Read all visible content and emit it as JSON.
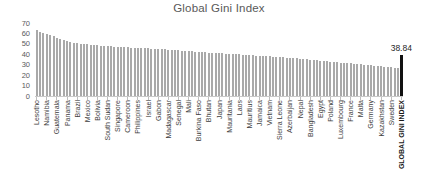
{
  "chart_data": {
    "type": "bar",
    "title": "Global Gini Index",
    "xlabel": "",
    "ylabel": "",
    "ylim": [
      0,
      70
    ],
    "yticks": [
      0,
      10,
      20,
      30,
      40,
      50,
      60,
      70
    ],
    "grid": false,
    "legend": false,
    "x_label_interval": 3,
    "bar_color": "#a9a9a9",
    "highlight_color": "#111111",
    "annotation": {
      "label": "38.84",
      "target": "GLOBAL GINI INDEX"
    },
    "bars": [
      {
        "label": "Lesotho",
        "value": 63.0
      },
      {
        "label": "",
        "value": 61.8
      },
      {
        "label": "",
        "value": 60.7
      },
      {
        "label": "Namibia",
        "value": 59.7
      },
      {
        "label": "",
        "value": 58.6
      },
      {
        "label": "",
        "value": 57.4
      },
      {
        "label": "Guatemala",
        "value": 56.0
      },
      {
        "label": "",
        "value": 54.8
      },
      {
        "label": "",
        "value": 53.6
      },
      {
        "label": "Panama",
        "value": 52.6
      },
      {
        "label": "",
        "value": 51.8
      },
      {
        "label": "",
        "value": 51.2
      },
      {
        "label": "Brazil",
        "value": 50.7
      },
      {
        "label": "",
        "value": 50.2
      },
      {
        "label": "",
        "value": 49.8
      },
      {
        "label": "Mexico",
        "value": 49.4
      },
      {
        "label": "",
        "value": 49.1
      },
      {
        "label": "",
        "value": 48.8
      },
      {
        "label": "Bolivia",
        "value": 48.5
      },
      {
        "label": "",
        "value": 48.2
      },
      {
        "label": "",
        "value": 48.0
      },
      {
        "label": "South Sudan",
        "value": 47.8
      },
      {
        "label": "",
        "value": 47.6
      },
      {
        "label": "",
        "value": 47.4
      },
      {
        "label": "Singapore",
        "value": 47.2
      },
      {
        "label": "",
        "value": 47.0
      },
      {
        "label": "",
        "value": 46.8
      },
      {
        "label": "Cameroon",
        "value": 46.6
      },
      {
        "label": "",
        "value": 46.5
      },
      {
        "label": "",
        "value": 46.3
      },
      {
        "label": "Philippines",
        "value": 46.1
      },
      {
        "label": "",
        "value": 45.9
      },
      {
        "label": "",
        "value": 45.8
      },
      {
        "label": "Israel",
        "value": 45.6
      },
      {
        "label": "",
        "value": 45.4
      },
      {
        "label": "",
        "value": 45.2
      },
      {
        "label": "Gabon",
        "value": 45.0
      },
      {
        "label": "",
        "value": 44.8
      },
      {
        "label": "",
        "value": 44.6
      },
      {
        "label": "Madagascar",
        "value": 44.4
      },
      {
        "label": "",
        "value": 44.1
      },
      {
        "label": "",
        "value": 43.9
      },
      {
        "label": "Senegal",
        "value": 43.7
      },
      {
        "label": "",
        "value": 43.4
      },
      {
        "label": "",
        "value": 43.2
      },
      {
        "label": "Mali",
        "value": 43.0
      },
      {
        "label": "",
        "value": 42.7
      },
      {
        "label": "",
        "value": 42.5
      },
      {
        "label": "Burkina Faso",
        "value": 42.3
      },
      {
        "label": "",
        "value": 42.0
      },
      {
        "label": "",
        "value": 41.8
      },
      {
        "label": "Bhutan",
        "value": 41.6
      },
      {
        "label": "",
        "value": 41.4
      },
      {
        "label": "",
        "value": 41.2
      },
      {
        "label": "Japan",
        "value": 41.0
      },
      {
        "label": "",
        "value": 40.8
      },
      {
        "label": "",
        "value": 40.6
      },
      {
        "label": "Mauritania",
        "value": 40.4
      },
      {
        "label": "",
        "value": 40.2
      },
      {
        "label": "",
        "value": 40.0
      },
      {
        "label": "Laos",
        "value": 39.8
      },
      {
        "label": "",
        "value": 39.6
      },
      {
        "label": "",
        "value": 39.4
      },
      {
        "label": "Mauritius",
        "value": 39.2
      },
      {
        "label": "",
        "value": 39.0
      },
      {
        "label": "",
        "value": 38.8
      },
      {
        "label": "Jamaica",
        "value": 38.6
      },
      {
        "label": "",
        "value": 38.4
      },
      {
        "label": "",
        "value": 38.2
      },
      {
        "label": "Vietnam",
        "value": 38.0
      },
      {
        "label": "",
        "value": 37.8
      },
      {
        "label": "",
        "value": 37.5
      },
      {
        "label": "Sierra Leone",
        "value": 37.3
      },
      {
        "label": "",
        "value": 37.0
      },
      {
        "label": "",
        "value": 36.8
      },
      {
        "label": "Azerbaijan",
        "value": 36.5
      },
      {
        "label": "",
        "value": 36.2
      },
      {
        "label": "",
        "value": 36.0
      },
      {
        "label": "Nepal",
        "value": 35.7
      },
      {
        "label": "",
        "value": 35.4
      },
      {
        "label": "",
        "value": 35.1
      },
      {
        "label": "Bangladesh",
        "value": 34.8
      },
      {
        "label": "",
        "value": 34.5
      },
      {
        "label": "",
        "value": 34.2
      },
      {
        "label": "Egypt",
        "value": 33.9
      },
      {
        "label": "",
        "value": 33.6
      },
      {
        "label": "",
        "value": 33.3
      },
      {
        "label": "Poland",
        "value": 33.0
      },
      {
        "label": "",
        "value": 32.7
      },
      {
        "label": "",
        "value": 32.4
      },
      {
        "label": "Luxembourg",
        "value": 32.1
      },
      {
        "label": "",
        "value": 31.8
      },
      {
        "label": "",
        "value": 31.5
      },
      {
        "label": "France",
        "value": 31.2
      },
      {
        "label": "",
        "value": 30.9
      },
      {
        "label": "",
        "value": 30.6
      },
      {
        "label": "Malta",
        "value": 30.3
      },
      {
        "label": "",
        "value": 30.0
      },
      {
        "label": "",
        "value": 29.7
      },
      {
        "label": "Germany",
        "value": 29.4
      },
      {
        "label": "",
        "value": 29.1
      },
      {
        "label": "",
        "value": 28.8
      },
      {
        "label": "Kazakhstan",
        "value": 28.5
      },
      {
        "label": "",
        "value": 28.2
      },
      {
        "label": "",
        "value": 27.9
      },
      {
        "label": "Sweden",
        "value": 27.6
      },
      {
        "label": "",
        "value": 27.3
      },
      {
        "label": "",
        "value": 27.0
      },
      {
        "label": "GLOBAL GINI INDEX",
        "value": 38.84,
        "highlight": true
      }
    ]
  }
}
